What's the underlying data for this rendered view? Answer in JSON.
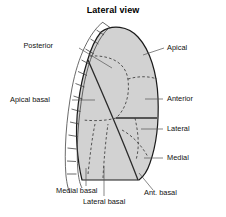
{
  "figure": {
    "title": "Lateral view",
    "background_color": "#ffffff",
    "lung_fill_color": "#d2d2d2",
    "outline_color": "#1a1a1a",
    "dashed_boundary_color": "#333333",
    "fissure_color": "#555555",
    "label_color": "#111111",
    "leader_color": "#555555"
  },
  "labels": {
    "posterior": "Posterior",
    "apical": "Apical",
    "apical_basal": "Apical basal",
    "anterior": "Anterior",
    "lateral": "Lateral",
    "medial": "Medial",
    "medial_basal": "Medial basal",
    "lateral_basal": "Lateral basal",
    "ant_basal": "Ant. basal"
  },
  "rib_ladder": {
    "name": "rib-cage-ladder",
    "rung_count": 11
  }
}
